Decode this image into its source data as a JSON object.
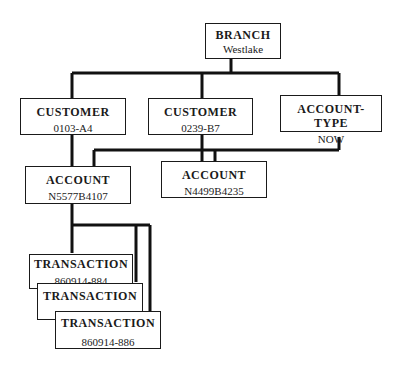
{
  "diagram": {
    "type": "hierarchical-database-tree",
    "nodes": [
      {
        "id": "branch",
        "title": "BRANCH",
        "value": "Westlake"
      },
      {
        "id": "customer1",
        "title": "CUSTOMER",
        "value": "0103-A4"
      },
      {
        "id": "customer2",
        "title": "CUSTOMER",
        "value": "0239-B7"
      },
      {
        "id": "account_type",
        "title": "ACCOUNT-TYPE",
        "value": "NOW"
      },
      {
        "id": "account1",
        "title": "ACCOUNT",
        "value": "N5577B4107"
      },
      {
        "id": "account2",
        "title": "ACCOUNT",
        "value": "N4499B4235"
      },
      {
        "id": "tx1",
        "title": "TRANSACTION",
        "value": "860914-884"
      },
      {
        "id": "tx2",
        "title": "TRANSACTION",
        "value": "860914-885"
      },
      {
        "id": "tx3",
        "title": "TRANSACTION",
        "value": "860914-886"
      }
    ],
    "edges": [
      [
        "branch",
        "customer1"
      ],
      [
        "branch",
        "customer2"
      ],
      [
        "branch",
        "account_type"
      ],
      [
        "customer1",
        "account1"
      ],
      [
        "customer2",
        "account1"
      ],
      [
        "customer2",
        "account2"
      ],
      [
        "account_type",
        "account1"
      ],
      [
        "account_type",
        "account2"
      ],
      [
        "account1",
        "tx1"
      ],
      [
        "account1",
        "tx2"
      ],
      [
        "account1",
        "tx3"
      ]
    ]
  }
}
